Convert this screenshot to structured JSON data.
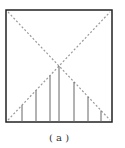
{
  "figure": {
    "caption": "( a )",
    "box": {
      "x1": 6,
      "y1": 10,
      "x2": 112,
      "y2": 122,
      "stroke": "#222222"
    },
    "diagonals": {
      "stroke": "#999999",
      "style": "dotted"
    },
    "vertical_lines": {
      "stroke": "#666666",
      "x_positions": [
        22,
        36,
        50,
        59,
        74,
        88,
        101
      ]
    }
  }
}
